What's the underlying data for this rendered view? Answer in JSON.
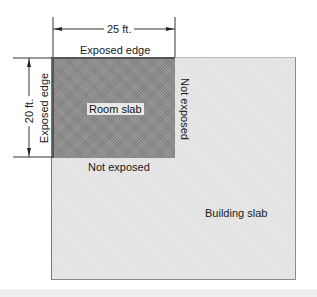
{
  "diagram": {
    "labels": {
      "room_slab": "Room slab",
      "building_slab": "Building slab",
      "top_edge": "Exposed edge",
      "left_edge": "Exposed edge",
      "right_edge": "Not exposed",
      "bottom_edge": "Not exposed"
    },
    "dimensions": {
      "width": "25 ft.",
      "height": "20 ft."
    },
    "colors": {
      "room_slab_fill": "#8c8c8c",
      "building_slab_fill": "#e6e6e6",
      "line": "#222222"
    }
  }
}
